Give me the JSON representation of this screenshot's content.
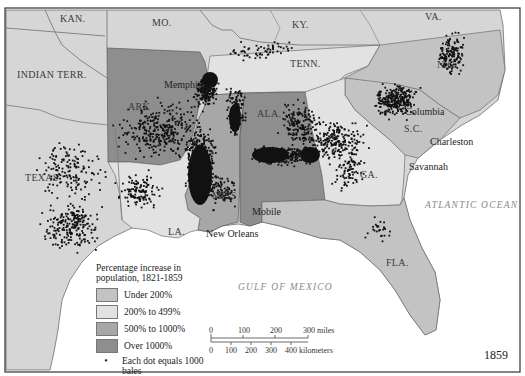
{
  "map": {
    "year": "1859",
    "colors": {
      "under_200": "#c3c3c3",
      "200_to_499": "#e2e2e2",
      "500_to_1000": "#a7a7a7",
      "over_1000": "#8e8e8e",
      "other_land": "#d6d6d6",
      "water": "#ffffff",
      "border": "#6e6e6e",
      "dot": "#111111"
    },
    "states": {
      "kan": "KAN.",
      "mo": "MO.",
      "ky": "KY.",
      "va": "VA.",
      "indian_terr": "INDIAN TERR.",
      "tenn": "TENN.",
      "nc": "N.C.",
      "ark": "ARK",
      "ala": "ALA.",
      "sc": "S.C.",
      "texas": "TEXAS",
      "miss": "MISS",
      "ga": "GA.",
      "la": "LA.",
      "fla": "FLA."
    },
    "cities": {
      "memphis": "Memphis",
      "columbia": "Columbia",
      "charleston": "Charleston",
      "savannah": "Savannah",
      "mobile": "Mobile",
      "new_orleans": "New Orleans"
    },
    "water_bodies": {
      "atlantic": "ATLANTIC OCEAN",
      "gulf": "GULF OF MEXICO"
    }
  },
  "legend": {
    "title": "Percentage increase in population, 1821-1859",
    "items": [
      {
        "label": "Under 200%",
        "category": "under_200"
      },
      {
        "label": "200% to 499%",
        "category": "200_to_499"
      },
      {
        "label": "500% to 1000%",
        "category": "500_to_1000"
      },
      {
        "label": "Over 1000%",
        "category": "over_1000"
      }
    ],
    "dot_symbol": "•",
    "dot_label": "Each dot equals 1000 bales"
  },
  "scale_bar": {
    "miles_ticks": [
      "0",
      "100",
      "200",
      "300 miles"
    ],
    "km_ticks": [
      "0",
      "100",
      "200",
      "300",
      "400 kilometers"
    ]
  }
}
